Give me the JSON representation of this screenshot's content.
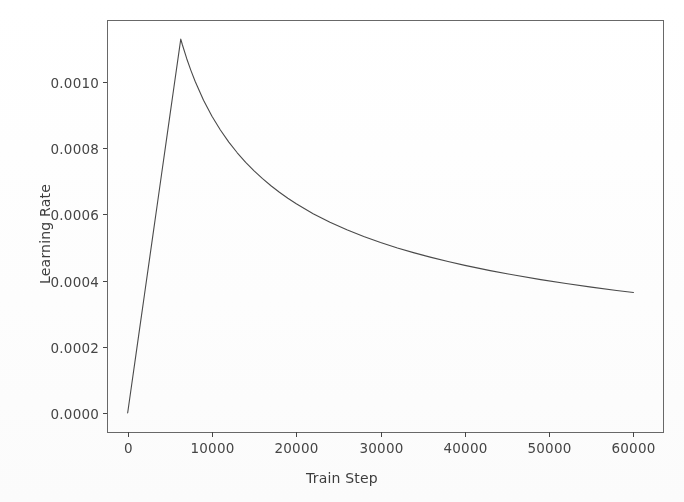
{
  "chart_data": {
    "type": "line",
    "title": "",
    "xlabel": "Train Step",
    "ylabel": "Learning Rate",
    "xlim": [
      -2450,
      63500
    ],
    "ylim": [
      -5.75e-05,
      0.0011875
    ],
    "grid": false,
    "legend": null,
    "xticks": [
      0,
      10000,
      20000,
      30000,
      40000,
      50000,
      60000
    ],
    "xtick_labels": [
      "0",
      "10000",
      "20000",
      "30000",
      "40000",
      "50000",
      "60000"
    ],
    "yticks": [
      0.0,
      0.0002,
      0.0004,
      0.0006,
      0.0008,
      0.001
    ],
    "ytick_labels": [
      "0.0000",
      "0.0002",
      "0.0004",
      "0.0006",
      "0.0008",
      "0.0010"
    ],
    "series": [
      {
        "name": "learning rate schedule",
        "color": "#4a4a4a",
        "linewidth": 1.1,
        "x": [
          0,
          500,
          1000,
          1500,
          2000,
          2500,
          3000,
          3500,
          4000,
          4500,
          5000,
          5500,
          6000,
          6300,
          6500,
          7000,
          7500,
          8000,
          9000,
          10000,
          11000,
          12000,
          13000,
          14000,
          15000,
          16000,
          17000,
          18000,
          19000,
          20000,
          22000,
          24000,
          26000,
          28000,
          30000,
          32000,
          34000,
          36000,
          38000,
          40000,
          43000,
          46000,
          49000,
          52000,
          55000,
          58000,
          60000
        ],
        "y": [
          0.0,
          8.97e-05,
          0.0001794,
          0.000269,
          0.0003587,
          0.0004484,
          0.0005381,
          0.0006278,
          0.0007175,
          0.0008071,
          0.0008968,
          0.0009865,
          0.0010762,
          0.00113,
          0.001112,
          0.0010713,
          0.0010353,
          0.0010026,
          0.0009452,
          0.0008968,
          0.000855,
          0.0008186,
          0.0007863,
          0.0007575,
          0.0007316,
          0.0007081,
          0.0006867,
          0.0006671,
          0.000649,
          0.0006322,
          0.0006022,
          0.0005762,
          0.0005534,
          0.0005331,
          0.000515,
          0.0004986,
          0.0004838,
          0.0004702,
          0.0004576,
          0.000446,
          0.0004302,
          0.000416,
          0.000403,
          0.0003912,
          0.0003803,
          0.0003702,
          0.000364
        ],
        "annotations": [
          {
            "label": "warmup peak",
            "x": 6300,
            "y": 0.00113
          },
          {
            "label": "final value",
            "x": 60000,
            "y": 0.000364
          }
        ]
      }
    ],
    "axes_box": {
      "left": 107,
      "right": 663,
      "top": 20,
      "bottom": 432,
      "edge_color": "#4d4d4d"
    }
  },
  "figure": {
    "background": "#ffffff",
    "tick_color": "#454545",
    "label_color": "#3d3d3d"
  }
}
